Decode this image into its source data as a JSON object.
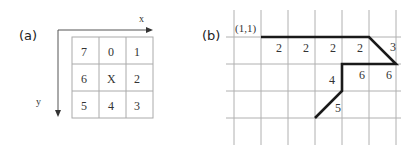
{
  "panel_a": {
    "label": "(a)",
    "x_axis_label": "x",
    "y_axis_label": "y",
    "cells": [
      [
        "7",
        "0",
        "1"
      ],
      [
        "6",
        "X",
        "2"
      ],
      [
        "5",
        "4",
        "3"
      ]
    ]
  },
  "panel_b": {
    "label": "(b)",
    "start_label": "(1,1)",
    "chain_codes": [
      {
        "value": "2",
        "x": 276,
        "y": 52
      },
      {
        "value": "2",
        "x": 303,
        "y": 52
      },
      {
        "value": "2",
        "x": 330,
        "y": 52
      },
      {
        "value": "2",
        "x": 357,
        "y": 52
      },
      {
        "value": "3",
        "x": 390,
        "y": 51
      },
      {
        "value": "6",
        "x": 359,
        "y": 79
      },
      {
        "value": "6",
        "x": 386,
        "y": 79
      },
      {
        "value": "4",
        "x": 332,
        "y": 84
      },
      {
        "value": "5",
        "x": 339,
        "y": 111
      }
    ],
    "colors": {
      "grid": "#b0b0b0",
      "path": "#1a1a1a"
    }
  }
}
